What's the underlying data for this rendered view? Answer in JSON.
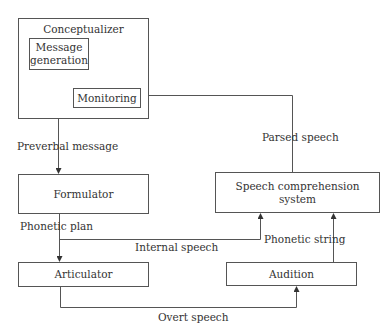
{
  "diagram": {
    "type": "flowchart",
    "nodes": {
      "conceptualizer": {
        "label": "Conceptualizer"
      },
      "message_generation": {
        "label": "Message generation"
      },
      "monitoring": {
        "label": "Monitoring"
      },
      "formulator": {
        "label": "Formulator"
      },
      "articulator": {
        "label": "Articulator"
      },
      "speech_comprehension": {
        "label": "Speech comprehension system"
      },
      "audition": {
        "label": "Audition"
      }
    },
    "edges": {
      "preverbal_message": {
        "label": "Preverbal message",
        "from": "Message generation",
        "to": "Formulator"
      },
      "phonetic_plan": {
        "label": "Phonetic plan",
        "from": "Formulator",
        "to": "Articulator"
      },
      "internal_speech": {
        "label": "Internal speech",
        "from": "Phonetic plan",
        "to": "Speech comprehension system"
      },
      "overt_speech": {
        "label": "Overt speech",
        "from": "Articulator",
        "to": "Audition"
      },
      "phonetic_string": {
        "label": "Phonetic string",
        "from": "Audition",
        "to": "Speech comprehension system"
      },
      "parsed_speech": {
        "label": "Parsed speech",
        "from": "Speech comprehension system",
        "to": "Monitoring"
      },
      "monitor_feedback": {
        "label": "",
        "from": "Monitoring",
        "to": "Message generation"
      },
      "message_to_monitor": {
        "label": "",
        "from": "Message generation",
        "to": "Monitoring"
      }
    }
  },
  "colors": {
    "line": "#555555",
    "text": "#333333",
    "background": "#ffffff"
  }
}
